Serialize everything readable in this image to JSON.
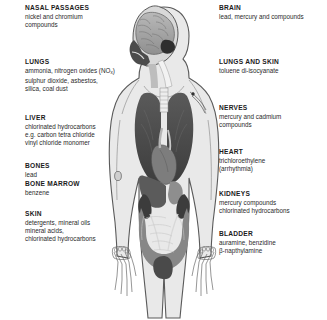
{
  "diagram": {
    "figure": {
      "name": "human-body-anatomical-figure",
      "description": "Frontal human body outline with sagittal head section showing brain, thoracic cavity with lungs and heart, abdominal organs including liver, kidneys, intestines and bladder, and skeletal detail in both hands"
    },
    "colors": {
      "background": "#ffffff",
      "heading_text": "#1b1b1b",
      "body_text": "#2a2a2a",
      "body_fill": "#e8e8e8",
      "outline": "#4a4a4a",
      "organ_dark": "#4f4f4f",
      "organ_mid": "#8a8a8a",
      "organ_light": "#c4c4c4"
    },
    "left_labels": [
      {
        "id": "nasal-passages",
        "heading": "NASAL PASSAGES",
        "lines": [
          "nickel and chromium",
          "compounds"
        ]
      },
      {
        "id": "lungs",
        "heading": "LUNGS",
        "lines": [
          "ammonia, nitrogen oxides (NO",
          "sulphur dioxide, asbestos,",
          "silica, coal dust"
        ],
        "subscript_note": "x"
      },
      {
        "id": "liver",
        "heading": "LIVER",
        "lines": [
          "chlorinated hydrocarbons",
          "e.g.  carbon tetra chloride",
          "vinyl chloride monomer"
        ]
      },
      {
        "id": "bones",
        "heading": "BONES",
        "lines": [
          "lead"
        ]
      },
      {
        "id": "bone-marrow",
        "heading": "BONE MARROW",
        "lines": [
          "benzene"
        ]
      },
      {
        "id": "skin",
        "heading": "SKIN",
        "lines": [
          "detergents, mineral oils",
          "mineral acids,",
          "chlorinated hydrocarbons"
        ]
      }
    ],
    "right_labels": [
      {
        "id": "brain",
        "heading": "BRAIN",
        "lines": [
          "lead, mercury and compounds"
        ]
      },
      {
        "id": "lungs-and-skin",
        "heading": "LUNGS AND SKIN",
        "lines": [
          "toluene di-isocyanate"
        ]
      },
      {
        "id": "nerves",
        "heading": "NERVES",
        "lines": [
          "mercury and  cadmium",
          "compounds"
        ]
      },
      {
        "id": "heart",
        "heading": "HEART",
        "lines": [
          "trichloroethylene",
          "(arrhythmia)"
        ]
      },
      {
        "id": "kidneys",
        "heading": "KIDNEYS",
        "lines": [
          "mercury compounds",
          "chlorinated hydrocarbons"
        ]
      },
      {
        "id": "bladder",
        "heading": "BLADDER",
        "lines": [
          "auramine, benzidine",
          "β-napthylamine"
        ]
      }
    ]
  }
}
